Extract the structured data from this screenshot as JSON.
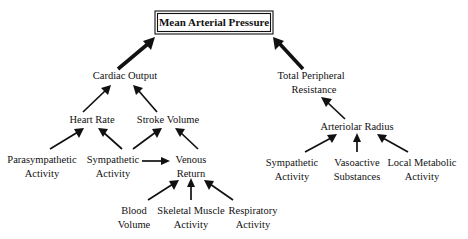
{
  "diagram": {
    "title": "Mean Arterial Pressure",
    "background_color": "#ffffff",
    "line_color": "#111111",
    "nodes": {
      "mean_arterial_pressure": "Mean Arterial Pressure",
      "cardiac_output": "Cardiac Output",
      "total_peripheral_line1": "Total Peripheral",
      "total_peripheral_line2": "Resistance",
      "heart_rate": "Heart Rate",
      "stroke_volume": "Stroke Volume",
      "arteriolar_radius": "Arteriolar Radius",
      "parasympathetic_line1": "Parasympathetic",
      "parasympathetic_line2": "Activity",
      "sympathetic_left_line1": "Sympathetic",
      "sympathetic_left_line2": "Activity",
      "venous_return_line1": "Venous",
      "venous_return_line2": "Return",
      "blood_volume_line1": "Blood",
      "blood_volume_line2": "Volume",
      "skeletal_muscle_line1": "Skeletal Muscle",
      "skeletal_muscle_line2": "Activity",
      "respiratory_line1": "Respiratory",
      "respiratory_line2": "Activity",
      "sympathetic_right_line1": "Sympathetic",
      "sympathetic_right_line2": "Activity",
      "vasoactive_line1": "Vasoactive",
      "vasoactive_line2": "Substances",
      "local_metabolic_line1": "Local Metabolic",
      "local_metabolic_line2": "Activity"
    },
    "edges": [
      "Cardiac Output -> Mean Arterial Pressure",
      "Total Peripheral Resistance -> Mean Arterial Pressure",
      "Heart Rate -> Cardiac Output",
      "Stroke Volume -> Cardiac Output",
      "Parasympathetic Activity -> Heart Rate",
      "Sympathetic Activity -> Heart Rate",
      "Sympathetic Activity -> Stroke Volume",
      "Venous Return -> Stroke Volume",
      "Sympathetic Activity -> Venous Return",
      "Blood Volume -> Venous Return",
      "Skeletal Muscle Activity -> Venous Return",
      "Respiratory Activity -> Venous Return",
      "Arteriolar Radius -> Total Peripheral Resistance",
      "Sympathetic Activity -> Arteriolar Radius",
      "Vasoactive Substances -> Arteriolar Radius",
      "Local Metabolic Activity -> Arteriolar Radius"
    ]
  }
}
